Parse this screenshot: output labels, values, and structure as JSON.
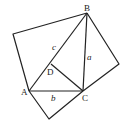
{
  "diagram": {
    "type": "geometry",
    "stroke_color": "#222222",
    "points": {
      "A": [
        29,
        91
      ],
      "B": [
        87,
        13
      ],
      "C": [
        83,
        91
      ],
      "D": [
        51,
        64
      ],
      "SqLeft": [
        13,
        34
      ],
      "SqRight": [
        119,
        64
      ],
      "SqBottom": [
        49,
        119
      ]
    },
    "labels": {
      "A": "A",
      "B": "B",
      "C": "C",
      "D": "D",
      "side_a": "a",
      "side_b": "b",
      "side_c": "c"
    }
  }
}
